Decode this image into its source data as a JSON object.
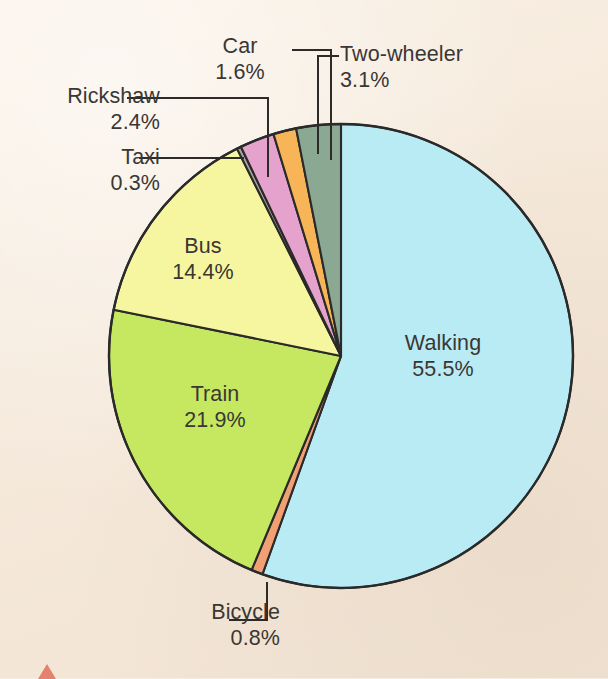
{
  "chart_data": {
    "type": "pie",
    "title": "",
    "subtitle": "",
    "xlabel": "",
    "ylabel": "",
    "legend_position": "none",
    "grid": false,
    "units": "percent",
    "total": 100.0,
    "categories": [
      "Walking",
      "Bicycle",
      "Train",
      "Bus",
      "Taxi",
      "Rickshaw",
      "Car",
      "Two-wheeler"
    ],
    "values": [
      55.5,
      0.8,
      21.9,
      14.4,
      0.3,
      2.4,
      1.6,
      3.1
    ],
    "start_angle_deg": 0,
    "direction": "clockwise",
    "slices": [
      {
        "label": "Walking",
        "value": 55.5,
        "value_text": "55.5%",
        "color": "#b9ebf5",
        "label_placement": "inside"
      },
      {
        "label": "Bicycle",
        "value": 0.8,
        "value_text": "0.8%",
        "color": "#f0a072",
        "label_placement": "outside"
      },
      {
        "label": "Train",
        "value": 21.9,
        "value_text": "21.9%",
        "color": "#c5e860",
        "label_placement": "inside"
      },
      {
        "label": "Bus",
        "value": 14.4,
        "value_text": "14.4%",
        "color": "#f7f6a0",
        "label_placement": "inside"
      },
      {
        "label": "Taxi",
        "value": 0.3,
        "value_text": "0.3%",
        "color": "#a9a39c",
        "label_placement": "outside"
      },
      {
        "label": "Rickshaw",
        "value": 2.4,
        "value_text": "2.4%",
        "color": "#e4a2cd",
        "label_placement": "outside"
      },
      {
        "label": "Car",
        "value": 1.6,
        "value_text": "1.6%",
        "color": "#f8b558",
        "label_placement": "outside"
      },
      {
        "label": "Two-wheeler",
        "value": 3.1,
        "value_text": "3.1%",
        "color": "#8aa892",
        "label_placement": "outside"
      }
    ]
  },
  "colors": {
    "background": "#f7ecdf",
    "outline": "#2a2a2a",
    "text": "#3a3733",
    "leader": "#2d2a27",
    "corner_mark": "#e2705d"
  },
  "labels": {
    "walking": {
      "name": "Walking",
      "pct": "55.5%"
    },
    "bicycle": {
      "name": "Bicycle",
      "pct": "0.8%"
    },
    "train": {
      "name": "Train",
      "pct": "21.9%"
    },
    "bus": {
      "name": "Bus",
      "pct": "14.4%"
    },
    "taxi": {
      "name": "Taxi",
      "pct": "0.3%"
    },
    "rickshaw": {
      "name": "Rickshaw",
      "pct": "2.4%"
    },
    "car": {
      "name": "Car",
      "pct": "1.6%"
    },
    "two_wheeler": {
      "name": "Two-wheeler",
      "pct": "3.1%"
    }
  }
}
